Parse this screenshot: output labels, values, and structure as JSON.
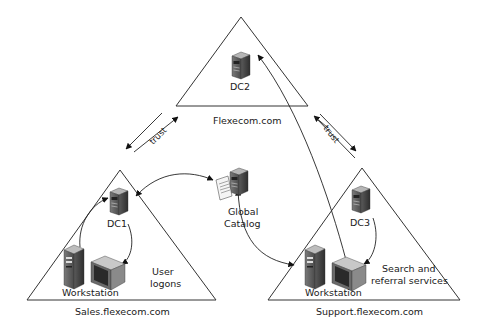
{
  "domains": [
    {
      "id": "flexecom",
      "label": "Flexecom.com",
      "dc": "DC2"
    },
    {
      "id": "sales",
      "label": "Sales.flexecom.com",
      "dc": "DC1",
      "workstation": "Workstation",
      "note": [
        "User",
        "logons"
      ]
    },
    {
      "id": "support",
      "label": "Support.flexecom.com",
      "dc": "DC3",
      "workstation": "Workstation",
      "note": [
        "Search and",
        "referral services"
      ]
    }
  ],
  "global_catalog": {
    "label": [
      "Global",
      "Catalog"
    ]
  },
  "trusts": [
    {
      "between": [
        "flexecom",
        "sales"
      ],
      "label": "trust"
    },
    {
      "between": [
        "flexecom",
        "support"
      ],
      "label": "trust"
    }
  ],
  "colors": {
    "line": "#222222",
    "server_dark": "#4a4a4a",
    "server_light": "#9a9a9a",
    "background": "#ffffff"
  }
}
